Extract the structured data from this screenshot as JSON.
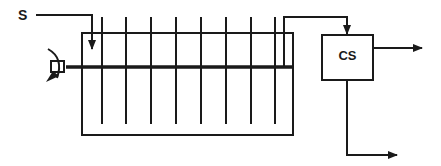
{
  "diagram": {
    "type": "process-flow-schematic",
    "labels": {
      "inlet": "S",
      "separator": "CS"
    },
    "colors": {
      "stroke": "#1a1a1a",
      "background": "#ffffff"
    },
    "components": {
      "tank": {
        "name": "contactor-tank"
      },
      "plates": {
        "count": 8
      },
      "shaft": {
        "name": "rotating-shaft"
      },
      "drive": {
        "name": "drive-motor",
        "rotation": "clockwise"
      },
      "separator": {
        "name": "clarifier-box",
        "label": "CS"
      }
    },
    "flows": [
      {
        "from": "S",
        "to": "tank"
      },
      {
        "from": "tank",
        "to": "CS"
      },
      {
        "from": "CS",
        "to": "effluent-right"
      },
      {
        "from": "CS",
        "to": "sludge-bottom"
      }
    ]
  }
}
